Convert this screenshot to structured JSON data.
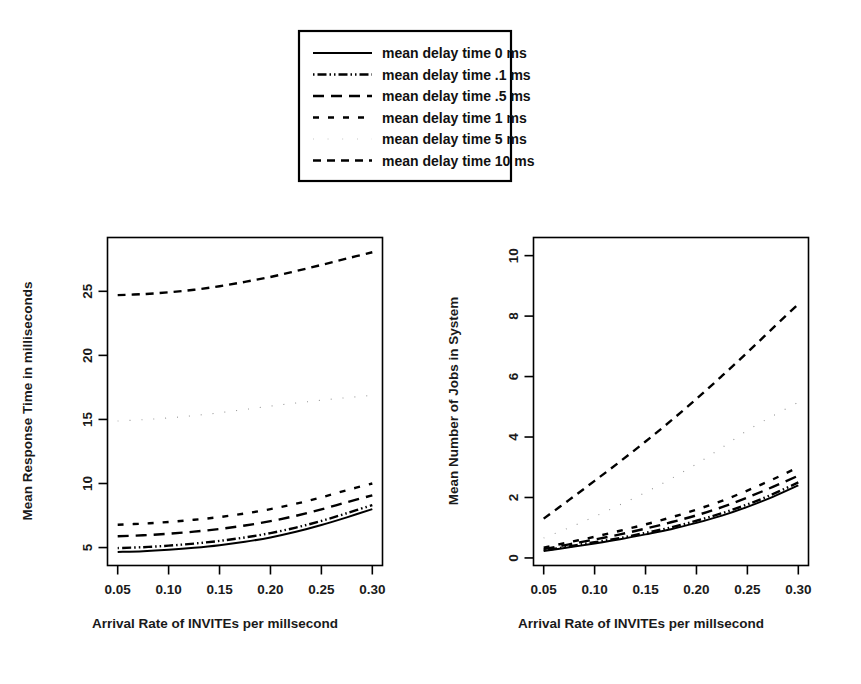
{
  "figure": {
    "background": "#ffffff",
    "ink_color": "#000000"
  },
  "legend": {
    "name": "plot-legend",
    "entries": [
      {
        "label": "mean delay time 0 ms",
        "delay_ms": 0,
        "style": "solid",
        "dasharray": "none"
      },
      {
        "label": "mean delay time .1 ms",
        "delay_ms": 0.1,
        "style": "dash-dot-dot",
        "dasharray": "1.5,3,9,3,1.5,3"
      },
      {
        "label": "mean delay time .5 ms",
        "delay_ms": 0.5,
        "style": "long-dash",
        "dasharray": "11,7"
      },
      {
        "label": "mean delay time 1 ms",
        "delay_ms": 1,
        "style": "short-dash",
        "dasharray": "6,9"
      },
      {
        "label": "mean delay time 5 ms",
        "delay_ms": 5,
        "style": "fine-dotted",
        "dasharray": "1,11"
      },
      {
        "label": "mean delay time 10 ms",
        "delay_ms": 10,
        "style": "dashed",
        "dasharray": "8,6"
      }
    ]
  },
  "chart_data": [
    {
      "id": "left-panel",
      "type": "line",
      "title": "",
      "xlabel": "Arrival Rate of INVITEs per millsecond",
      "ylabel": "Mean Response Time in milliseconds",
      "xlim": [
        0.04,
        0.31
      ],
      "ylim": [
        3.6,
        29.2
      ],
      "xticks": [
        0.05,
        0.1,
        0.15,
        0.2,
        0.25,
        0.3
      ],
      "xticklabels": [
        "0.05",
        "0.10",
        "0.15",
        "0.20",
        "0.25",
        "0.30"
      ],
      "yticks": [
        5,
        10,
        15,
        20,
        25
      ],
      "yticklabels": [
        "5",
        "10",
        "15",
        "20",
        "25"
      ],
      "grid": false,
      "legend_position": "above-figure",
      "x": [
        0.05,
        0.075,
        0.1,
        0.125,
        0.15,
        0.175,
        0.2,
        0.225,
        0.25,
        0.275,
        0.3
      ],
      "series": [
        {
          "name": "mean delay time 0 ms",
          "style": "solid",
          "values": [
            4.66,
            4.72,
            4.83,
            4.98,
            5.18,
            5.45,
            5.79,
            6.23,
            6.76,
            7.36,
            8.0
          ]
        },
        {
          "name": "mean delay time .1 ms",
          "style": "dash-dot-dot",
          "values": [
            4.96,
            5.03,
            5.15,
            5.31,
            5.52,
            5.79,
            6.13,
            6.56,
            7.08,
            7.68,
            8.32
          ]
        },
        {
          "name": "mean delay time .5 ms",
          "style": "long-dash",
          "values": [
            5.88,
            5.96,
            6.08,
            6.24,
            6.45,
            6.72,
            7.06,
            7.48,
            7.98,
            8.54,
            9.08
          ]
        },
        {
          "name": "mean delay time 1 ms",
          "style": "short-dash",
          "values": [
            6.78,
            6.87,
            7.0,
            7.17,
            7.38,
            7.66,
            8.0,
            8.42,
            8.92,
            9.48,
            10.0
          ]
        },
        {
          "name": "mean delay time 5 ms",
          "style": "fine-dotted",
          "values": [
            14.88,
            14.98,
            15.12,
            15.3,
            15.52,
            15.78,
            16.04,
            16.28,
            16.5,
            16.7,
            16.88
          ]
        },
        {
          "name": "mean delay time 10 ms",
          "style": "dashed",
          "values": [
            24.7,
            24.78,
            24.92,
            25.12,
            25.4,
            25.74,
            26.12,
            26.58,
            27.06,
            27.56,
            28.05
          ]
        }
      ]
    },
    {
      "id": "right-panel",
      "type": "line",
      "title": "",
      "xlabel": "Arrival Rate of INVITEs per millsecond",
      "ylabel": "Mean Number of Jobs in System",
      "xlim": [
        0.04,
        0.31
      ],
      "ylim": [
        -0.25,
        10.6
      ],
      "xticks": [
        0.05,
        0.1,
        0.15,
        0.2,
        0.25,
        0.3
      ],
      "xticklabels": [
        "0.05",
        "0.10",
        "0.15",
        "0.20",
        "0.25",
        "0.30"
      ],
      "yticks": [
        0,
        2,
        4,
        6,
        8,
        10
      ],
      "yticklabels": [
        "0",
        "2",
        "4",
        "6",
        "8",
        "10"
      ],
      "grid": false,
      "legend_position": "above-figure",
      "x": [
        0.05,
        0.075,
        0.1,
        0.125,
        0.15,
        0.175,
        0.2,
        0.225,
        0.25,
        0.275,
        0.3
      ],
      "series": [
        {
          "name": "mean delay time 0 ms",
          "style": "solid",
          "values": [
            0.23,
            0.35,
            0.48,
            0.62,
            0.78,
            0.95,
            1.16,
            1.4,
            1.69,
            2.02,
            2.4
          ]
        },
        {
          "name": "mean delay time .1 ms",
          "style": "dash-dot-dot",
          "values": [
            0.25,
            0.38,
            0.52,
            0.66,
            0.83,
            1.01,
            1.23,
            1.48,
            1.77,
            2.11,
            2.5
          ]
        },
        {
          "name": "mean delay time .5 ms",
          "style": "long-dash",
          "values": [
            0.29,
            0.45,
            0.61,
            0.78,
            0.97,
            1.18,
            1.41,
            1.68,
            2.0,
            2.35,
            2.72
          ]
        },
        {
          "name": "mean delay time 1 ms",
          "style": "short-dash",
          "values": [
            0.34,
            0.52,
            0.7,
            0.9,
            1.11,
            1.34,
            1.6,
            1.89,
            2.23,
            2.6,
            3.0
          ]
        },
        {
          "name": "mean delay time 5 ms",
          "style": "fine-dotted",
          "values": [
            0.66,
            1.0,
            1.37,
            1.76,
            2.17,
            2.62,
            3.11,
            3.65,
            4.22,
            4.7,
            5.15
          ]
        },
        {
          "name": "mean delay time 10 ms",
          "style": "dashed",
          "values": [
            1.3,
            1.92,
            2.55,
            3.19,
            3.85,
            4.54,
            5.26,
            6.02,
            6.8,
            7.6,
            8.4
          ]
        }
      ]
    }
  ]
}
